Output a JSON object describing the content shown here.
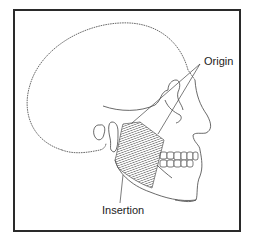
{
  "diagram": {
    "labels": {
      "origin": "Origin",
      "insertion": "Insertion"
    },
    "colors": {
      "frame": "#2a2a2a",
      "outline": "#444444",
      "muscle": "#6a6a6a",
      "background": "#ffffff"
    }
  }
}
